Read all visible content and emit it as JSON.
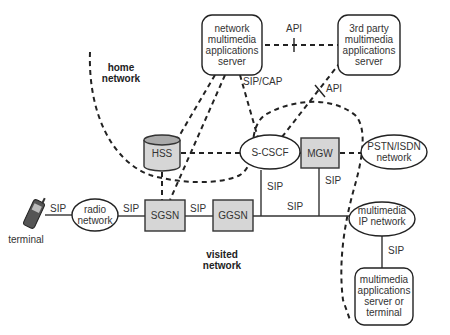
{
  "nodes": {
    "nmas": {
      "lines": [
        "network",
        "multimedia",
        "applications",
        "server"
      ]
    },
    "third_party": {
      "lines": [
        "3rd party",
        "multimedia",
        "applications",
        "server"
      ]
    },
    "hss": {
      "label": "HSS"
    },
    "scscf": {
      "label": "S-CSCF"
    },
    "mgw": {
      "label": "MGW"
    },
    "pstn": {
      "lines": [
        "PSTN/ISDN",
        "network"
      ]
    },
    "radio": {
      "lines": [
        "radio",
        "network"
      ]
    },
    "sgsn": {
      "label": "SGSN"
    },
    "ggsn": {
      "label": "GGSN"
    },
    "mm_ip": {
      "lines": [
        "multimedia",
        "IP network"
      ]
    },
    "mm_server": {
      "lines": [
        "multimedia",
        "applications",
        "server or",
        "terminal"
      ]
    },
    "terminal": {
      "label": "terminal"
    }
  },
  "regions": {
    "home": {
      "lines": [
        "home",
        "network"
      ]
    },
    "visited": {
      "lines": [
        "visited",
        "network"
      ]
    }
  },
  "edge_labels": {
    "api_top": "API",
    "api_diag": "API",
    "sip_cap": "SIP/CAP",
    "sip_scscf": "SIP",
    "sip_mgw": "SIP",
    "sip_main": "SIP",
    "sip_terminal_radio": "SIP",
    "sip_radio_sgsn": "SIP",
    "sip_sgsn_ggsn": "SIP",
    "sip_mmip_server": "SIP"
  }
}
